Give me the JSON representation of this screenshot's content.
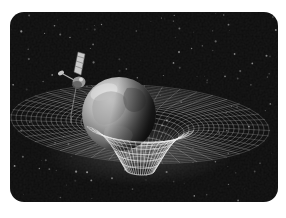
{
  "illustration": {
    "description": "Spacecraft above Earth resting in a curved spacetime grid (gravity well) over a black starfield, framed by a white border",
    "frame": {
      "x": 10,
      "y": 12,
      "width": 268,
      "height": 190,
      "radius": 14,
      "fill": "#0c0c0c"
    },
    "colors": {
      "page_background": "#ffffff",
      "star": "#d6d6d6",
      "grid_line": "#f2f2f2",
      "earth_light": "#e8e8e8",
      "earth_mid": "#b5b5b5",
      "earth_shadow": "#161616",
      "land_gray": "#9c9c9c",
      "satellite_panel": "#c9c9c9",
      "satellite_body": "#9a9a9a"
    },
    "stars": {
      "count": 150,
      "seed": 11
    },
    "mesh": {
      "cx": 140,
      "cy": 124,
      "flatten": 0.3,
      "tilt": 0.05,
      "depth": 59,
      "sigma": 29,
      "r_min": 14,
      "r_max": 130,
      "ring_step": 5,
      "spoke_step_deg": 8,
      "front_r_max": 56
    },
    "earth": {
      "cx": 119,
      "cy": 114,
      "r": 37
    },
    "satellite": {
      "body_x": 79,
      "body_y": 82
    }
  }
}
